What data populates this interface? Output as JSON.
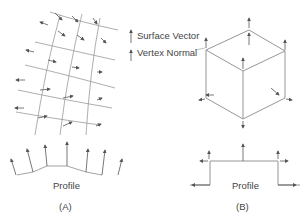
{
  "legend": {
    "surface_vector": "Surface Vector",
    "vertex_normal": "Vertex Normal"
  },
  "panel_a": {
    "profile_label": "Profile",
    "caption": "(A)"
  },
  "panel_b": {
    "profile_label": "Profile",
    "caption": "(B)"
  },
  "colors": {
    "line": "#8a8a8a",
    "arrow": "#555555",
    "text": "#444444"
  }
}
